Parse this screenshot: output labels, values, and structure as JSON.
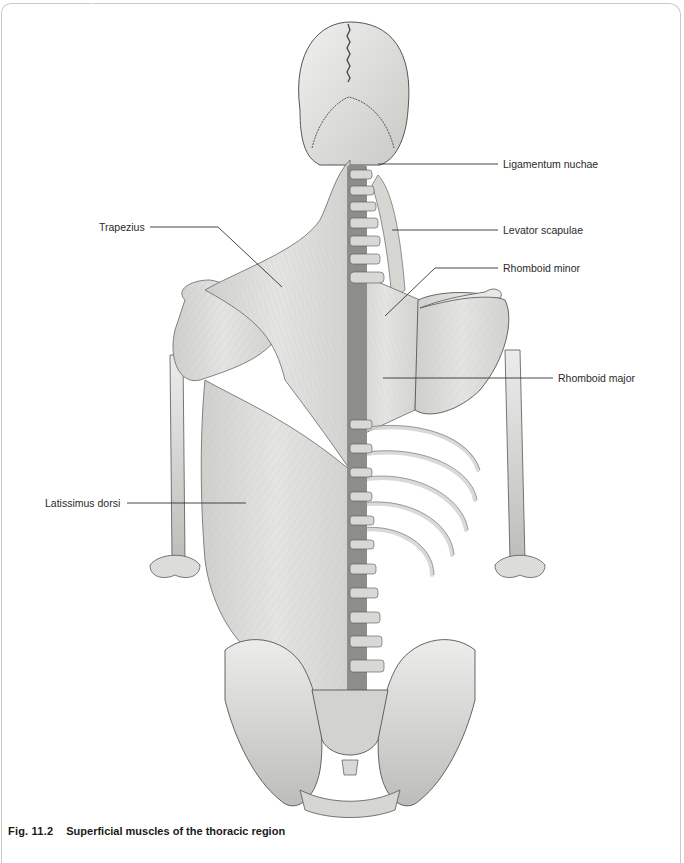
{
  "figure": {
    "number": "Fig. 11.2",
    "title": "Superficial muscles of the thoracic region"
  },
  "labels": [
    {
      "id": "ligamentum-nuchae",
      "text": "Ligamentum nuchae",
      "x": 503,
      "y": 158
    },
    {
      "id": "levator-scapulae",
      "text": "Levator scapulae",
      "x": 503,
      "y": 224
    },
    {
      "id": "rhomboid-minor",
      "text": "Rhomboid minor",
      "x": 503,
      "y": 262
    },
    {
      "id": "rhomboid-major",
      "text": "Rhomboid major",
      "x": 558,
      "y": 372
    },
    {
      "id": "trapezius",
      "text": "Trapezius",
      "x": 99,
      "y": 221
    },
    {
      "id": "latissimus-dorsi",
      "text": "Latissimus dorsi",
      "x": 45,
      "y": 497
    }
  ],
  "colors": {
    "bone": "#e6e6e4",
    "bone_shade": "#b9b9b6",
    "muscle": "#d9d9d7",
    "muscle_shade": "#c4c4c1",
    "outline": "#555555",
    "leader": "#333333",
    "frame": "#c8c8c8"
  }
}
